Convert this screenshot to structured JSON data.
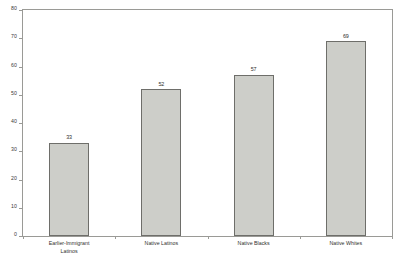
{
  "chart_data": {
    "type": "bar",
    "title": "",
    "subtitle": "",
    "xlabel": "",
    "ylabel": "",
    "ylim": [
      0,
      80
    ],
    "ytick_step": 10,
    "yticks": [
      0,
      10,
      20,
      30,
      40,
      50,
      60,
      70,
      80
    ],
    "ytick_labels": [
      "0",
      "10",
      "20",
      "30",
      "40",
      "50",
      "60",
      "70",
      "80"
    ],
    "grid": false,
    "legend": false,
    "legend_position": "none",
    "categories": [
      "Earlier-Immigrant Latinos",
      "Native Latinos",
      "Native Blacks",
      "Native Whites"
    ],
    "category_label_lines": [
      [
        "Earlier-Immigrant",
        "Latinos"
      ],
      [
        "Native Latinos"
      ],
      [
        "Native Blacks"
      ],
      [
        "Native Whites"
      ]
    ],
    "values": [
      33,
      52,
      57,
      69
    ],
    "value_labels": [
      "33",
      "52",
      "57",
      "69"
    ],
    "bar_fill_color": "#cdcec9",
    "bar_edge_color": "#6e6e6a",
    "axis_color": "#9a9a96",
    "text_color": "#2f2f2d",
    "background_color": "#ffffff"
  }
}
